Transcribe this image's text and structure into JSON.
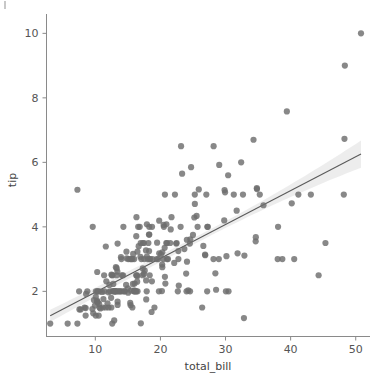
{
  "figure": {
    "width": 376,
    "height": 380,
    "background": "#ffffff"
  },
  "axis": {
    "x_title": "total_bill",
    "y_title": "tip",
    "x_ticks": [
      "10",
      "20",
      "30",
      "40",
      "50"
    ],
    "y_ticks": [
      "2",
      "4",
      "6",
      "8",
      "10"
    ]
  },
  "style": {
    "point_color": "#6e6e6e",
    "line_color": "#5a5a5a",
    "band_color": "#9a9a9a",
    "spine_color": "#8a8a8a",
    "text_color": "#555555"
  },
  "chart_data": {
    "type": "scatter",
    "title": "",
    "xlabel": "total_bill",
    "ylabel": "tip",
    "xlim": [
      2.5,
      52.5
    ],
    "ylim": [
      0.6,
      10.6
    ],
    "grid": false,
    "legend": false,
    "xticks": [
      10,
      20,
      30,
      40,
      50
    ],
    "yticks": [
      2,
      4,
      6,
      8,
      10
    ],
    "regression": {
      "show": true,
      "fit_type": "linear",
      "slope": 0.105,
      "intercept": 0.92,
      "x_start": 3.07,
      "x_end": 50.81,
      "y_start": 1.24,
      "y_end": 6.26,
      "confidence_interval": 95,
      "band_halfwidth_at_x_start": 0.19,
      "band_halfwidth_at_x_mid": 0.1,
      "band_halfwidth_at_x_end": 0.42
    },
    "series": [
      {
        "name": "tips",
        "x": [
          16.99,
          10.34,
          21.01,
          23.68,
          24.59,
          25.29,
          8.77,
          26.88,
          15.04,
          14.78,
          10.27,
          35.26,
          15.42,
          18.43,
          14.83,
          21.58,
          10.33,
          16.29,
          16.97,
          20.65,
          17.92,
          20.29,
          15.77,
          39.42,
          19.82,
          17.81,
          13.37,
          12.69,
          21.7,
          19.65,
          9.55,
          18.35,
          15.06,
          20.69,
          17.78,
          24.06,
          16.31,
          16.93,
          18.69,
          31.27,
          16.04,
          17.46,
          13.94,
          9.68,
          30.4,
          18.29,
          22.23,
          32.4,
          28.55,
          18.04,
          12.54,
          10.29,
          34.81,
          9.94,
          25.56,
          19.49,
          38.01,
          26.41,
          11.24,
          48.27,
          20.29,
          13.81,
          11.02,
          18.29,
          17.59,
          20.08,
          16.45,
          3.07,
          20.23,
          15.01,
          12.02,
          17.07,
          26.86,
          25.28,
          14.73,
          10.51,
          17.92,
          27.2,
          22.76,
          17.29,
          19.44,
          16.66,
          10.07,
          32.68,
          15.98,
          34.83,
          13.03,
          18.28,
          24.71,
          21.16,
          28.97,
          22.49,
          5.75,
          16.32,
          22.75,
          40.17,
          27.28,
          12.03,
          21.01,
          12.46,
          11.35,
          15.38,
          44.3,
          22.42,
          20.92,
          15.36,
          20.49,
          25.21,
          18.24,
          14.31,
          14.0,
          7.25,
          38.07,
          23.95,
          25.71,
          17.31,
          29.93,
          10.65,
          12.43,
          24.08,
          11.69,
          13.42,
          14.26,
          15.95,
          12.48,
          29.8,
          8.52,
          14.52,
          11.38,
          22.82,
          19.08,
          20.27,
          11.17,
          12.26,
          18.26,
          8.51,
          10.33,
          14.15,
          16.0,
          13.16,
          17.47,
          34.3,
          41.19,
          27.05,
          16.43,
          8.35,
          18.64,
          11.87,
          9.78,
          7.51,
          14.07,
          13.13,
          17.26,
          24.55,
          19.77,
          29.85,
          48.17,
          25.0,
          13.39,
          16.49,
          21.5,
          12.66,
          16.21,
          13.81,
          17.51,
          24.52,
          20.76,
          31.71,
          10.59,
          10.63,
          50.81,
          15.81,
          7.25,
          31.85,
          16.82,
          32.9,
          17.89,
          14.48,
          9.6,
          34.63,
          34.65,
          23.33,
          45.35,
          23.17,
          40.55,
          20.69,
          20.9,
          30.46,
          18.15,
          23.1,
          15.69,
          19.81,
          28.44,
          15.48,
          16.58,
          7.56,
          10.34,
          43.11,
          13.0,
          13.51,
          18.71,
          12.74,
          13.0,
          16.4,
          20.53,
          16.47,
          26.59,
          38.73,
          24.27,
          12.76,
          30.06,
          25.89,
          48.33,
          13.27,
          28.17,
          12.9,
          28.15,
          11.59,
          7.74,
          30.14,
          12.16,
          13.42,
          8.58,
          15.98,
          13.42,
          16.27,
          10.09,
          20.45,
          13.28,
          22.12,
          24.01,
          15.69,
          11.61,
          10.77,
          15.53,
          10.07,
          12.6,
          32.83,
          35.83,
          29.03,
          27.18,
          22.67,
          17.82,
          18.78
        ],
        "y": [
          1.01,
          1.66,
          3.5,
          3.31,
          3.61,
          4.71,
          2.0,
          3.12,
          1.96,
          3.23,
          1.71,
          5.0,
          1.57,
          3.0,
          3.02,
          3.92,
          1.67,
          3.71,
          3.5,
          3.35,
          4.08,
          2.75,
          2.23,
          7.58,
          3.18,
          2.34,
          2.0,
          2.0,
          4.3,
          3.0,
          1.45,
          2.5,
          3.0,
          2.45,
          3.27,
          3.6,
          2.0,
          3.07,
          2.31,
          5.0,
          2.24,
          2.54,
          3.06,
          1.32,
          5.6,
          3.0,
          5.0,
          6.0,
          2.05,
          3.0,
          2.5,
          2.6,
          5.2,
          1.56,
          4.34,
          3.51,
          3.0,
          1.5,
          1.76,
          6.73,
          3.21,
          2.0,
          1.98,
          3.76,
          2.64,
          3.15,
          2.47,
          1.0,
          2.01,
          2.09,
          1.97,
          3.0,
          3.14,
          5.0,
          2.2,
          1.25,
          3.08,
          4.0,
          3.0,
          2.71,
          3.0,
          3.4,
          1.83,
          5.0,
          2.03,
          5.17,
          2.0,
          4.0,
          5.85,
          3.0,
          3.0,
          3.5,
          1.0,
          4.3,
          3.25,
          4.73,
          4.0,
          1.5,
          3.0,
          1.5,
          2.5,
          3.0,
          2.5,
          3.48,
          4.08,
          1.64,
          4.06,
          4.29,
          3.76,
          4.0,
          3.0,
          1.0,
          4.0,
          2.55,
          4.0,
          3.5,
          5.07,
          1.5,
          1.8,
          2.92,
          2.31,
          1.68,
          2.5,
          2.0,
          2.52,
          4.2,
          1.48,
          2.0,
          2.0,
          2.18,
          1.5,
          2.83,
          1.5,
          2.0,
          3.25,
          1.25,
          2.0,
          2.0,
          2.0,
          2.75,
          3.5,
          6.7,
          5.0,
          5.0,
          2.3,
          1.5,
          1.36,
          1.63,
          1.73,
          2.0,
          2.5,
          2.0,
          2.5,
          2.0,
          2.0,
          5.14,
          5.0,
          3.75,
          2.61,
          2.0,
          3.5,
          2.5,
          2.0,
          2.0,
          3.0,
          3.48,
          2.24,
          4.5,
          1.61,
          2.0,
          10.0,
          3.16,
          5.15,
          3.18,
          4.0,
          3.11,
          2.0,
          2.0,
          4.0,
          3.55,
          3.68,
          5.65,
          3.5,
          6.5,
          3.0,
          5.0,
          3.5,
          2.0,
          3.5,
          4.0,
          1.5,
          4.19,
          2.56,
          2.02,
          4.0,
          1.44,
          2.0,
          5.0,
          2.0,
          2.0,
          4.0,
          2.01,
          2.0,
          2.5,
          4.0,
          3.23,
          3.41,
          3.0,
          2.03,
          2.23,
          2.0,
          5.16,
          9.0,
          2.5,
          6.5,
          1.1,
          3.0,
          1.5,
          1.44,
          3.09,
          2.2,
          3.48,
          1.92,
          3.0,
          1.58,
          2.5,
          2.0,
          3.0,
          2.72,
          2.88,
          2.0,
          3.0,
          3.39,
          1.47,
          3.0,
          1.25,
          1.0,
          1.17,
          4.67,
          5.92,
          2.0,
          2.0,
          1.75,
          3.0
        ]
      }
    ]
  }
}
